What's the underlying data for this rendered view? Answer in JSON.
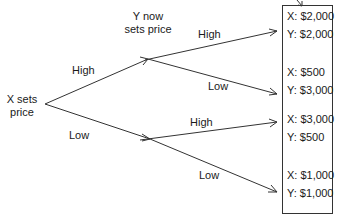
{
  "diagram": {
    "type": "game-tree",
    "root": {
      "label_line1": "X sets",
      "label_line2": "price"
    },
    "second_mover": {
      "label_line1": "Y now",
      "label_line2": "sets price"
    },
    "x_branches": [
      {
        "label": "High"
      },
      {
        "label": "Low"
      }
    ],
    "y_branches": [
      {
        "label": "High"
      },
      {
        "label": "Low"
      },
      {
        "label": "High"
      },
      {
        "label": "Low"
      }
    ],
    "outcomes": [
      {
        "x": "X: $2,000",
        "y": "Y: $2,000"
      },
      {
        "x": "X: $500",
        "y": "Y: $3,000"
      },
      {
        "x": "X: $3,000",
        "y": "Y: $500"
      },
      {
        "x": "X: $1,000",
        "y": "Y: $1,000"
      }
    ],
    "line_color": "#333333",
    "text_color": "#1a1a1a"
  }
}
